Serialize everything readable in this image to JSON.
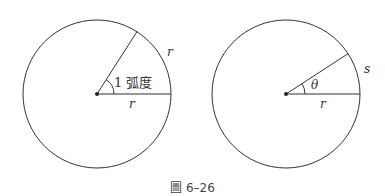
{
  "figure": {
    "caption": "圖 6–26",
    "left_diagram": {
      "arc_label": "r",
      "radius_label": "r",
      "angle_label": "1 弧度",
      "center": [
        97,
        94
      ],
      "radius": 75,
      "ray_angle_deg": 57.3
    },
    "right_diagram": {
      "arc_label": "s",
      "radius_label": "r",
      "angle_label": "θ",
      "center": [
        286,
        94
      ],
      "radius": 75,
      "ray_angle_deg": 33
    },
    "colors": {
      "stroke": "#333333",
      "text": "#333333",
      "caption": "#444444"
    }
  }
}
